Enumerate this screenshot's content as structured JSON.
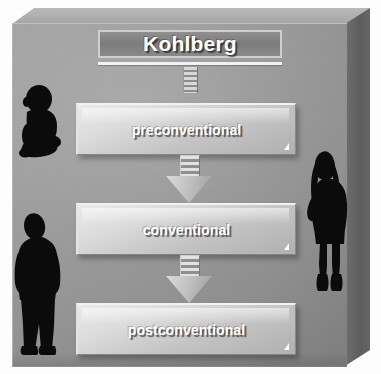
{
  "diagram": {
    "title": "Kohlberg",
    "stages": [
      {
        "label": "preconventional"
      },
      {
        "label": "conventional"
      },
      {
        "label": "postconventional"
      }
    ],
    "connectors": [
      {
        "name": "title-stub",
        "style": "striped-bar"
      },
      {
        "name": "arrow-preconventional-to-conventional",
        "style": "striped-down-arrow"
      },
      {
        "name": "arrow-conventional-to-postconventional",
        "style": "striped-down-arrow"
      }
    ],
    "figures": [
      {
        "name": "baby-silhouette",
        "position": "left-upper"
      },
      {
        "name": "man-silhouette",
        "position": "left-lower"
      },
      {
        "name": "woman-silhouette",
        "position": "right"
      }
    ],
    "colors": {
      "panel": "#9a9a9a",
      "title_bar": "#7c7c7c",
      "box_light": "#eaeaea",
      "box_dark": "#b0b0b0",
      "text": "#ffffff",
      "silhouette": "#0a0a0a"
    }
  }
}
